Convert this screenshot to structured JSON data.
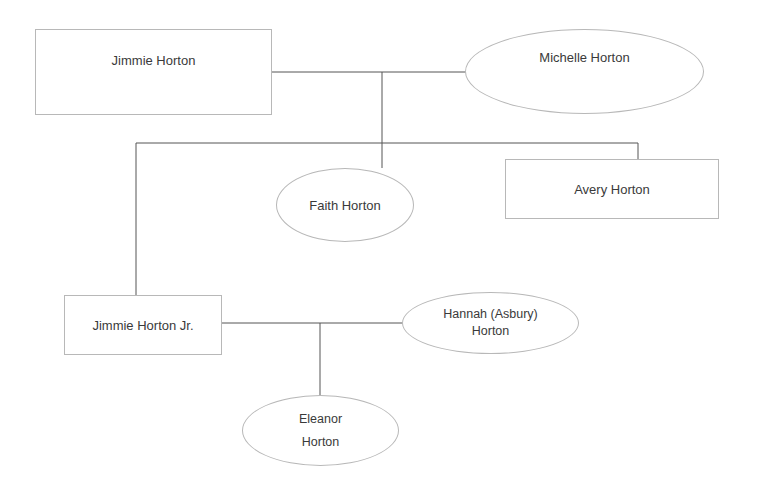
{
  "diagram": {
    "type": "family-tree",
    "line_color": "#555555",
    "border_color": "#b8b8b8",
    "nodes": {
      "jimmie_horton": {
        "label": "Jimmie Horton",
        "shape": "rectangle"
      },
      "michelle_horton": {
        "label": "Michelle Horton",
        "shape": "ellipse"
      },
      "faith_horton": {
        "label": "Faith Horton",
        "shape": "ellipse"
      },
      "avery_horton": {
        "label": "Avery Horton",
        "shape": "rectangle"
      },
      "jimmie_horton_jr": {
        "label": "Jimmie Horton Jr.",
        "shape": "rectangle"
      },
      "hannah_asbury_horton": {
        "label": "Hannah (Asbury)\nHorton",
        "shape": "ellipse"
      },
      "eleanor_horton": {
        "label": "Eleanor\nHorton",
        "shape": "ellipse"
      }
    },
    "relationships": [
      {
        "type": "couple",
        "members": [
          "Jimmie Horton",
          "Michelle Horton"
        ],
        "children": [
          "Jimmie Horton Jr.",
          "Faith Horton",
          "Avery Horton"
        ]
      },
      {
        "type": "couple",
        "members": [
          "Jimmie Horton Jr.",
          "Hannah (Asbury) Horton"
        ],
        "children": [
          "Eleanor Horton"
        ]
      }
    ]
  }
}
